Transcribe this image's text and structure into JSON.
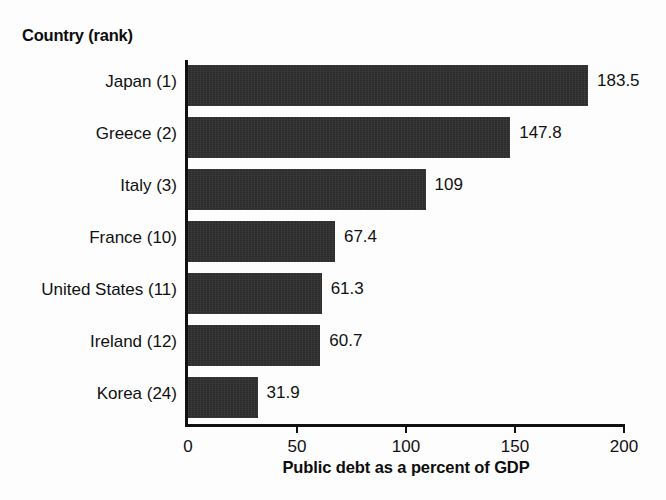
{
  "category_header": "Country (rank)",
  "chart_data": {
    "type": "bar",
    "orientation": "horizontal",
    "title": "",
    "xlabel": "Public debt as a percent of GDP",
    "ylabel": "Country (rank)",
    "categories": [
      "Japan (1)",
      "Greece (2)",
      "Italy (3)",
      "France (10)",
      "United States (11)",
      "Ireland (12)",
      "Korea (24)"
    ],
    "values": [
      183.5,
      147.8,
      109,
      67.4,
      61.3,
      60.7,
      31.9
    ],
    "value_labels": [
      "183.5",
      "147.8",
      "109",
      "67.4",
      "61.3",
      "60.7",
      "31.9"
    ],
    "xlim": [
      0,
      200
    ],
    "xticks": [
      0,
      50,
      100,
      150,
      200
    ],
    "xtick_labels": [
      "0",
      "50",
      "100",
      "150",
      "200"
    ],
    "grid": false,
    "legend": false,
    "bar_color": "#2b2b2b",
    "background_color": "#fdfdfd",
    "axis_color": "#111111"
  }
}
